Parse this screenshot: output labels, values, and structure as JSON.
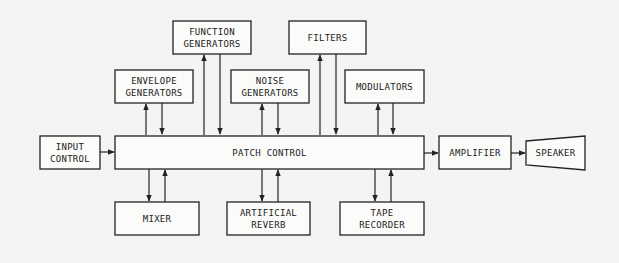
{
  "diagram": {
    "type": "block-diagram",
    "blocks": {
      "function_generators": [
        "FUNCTION",
        "GENERATORS"
      ],
      "filters": [
        "FILTERS"
      ],
      "envelope_generators": [
        "ENVELOPE",
        "GENERATORS"
      ],
      "noise_generators": [
        "NOISE",
        "GENERATORS"
      ],
      "modulators": [
        "MODULATORS"
      ],
      "input_control": [
        "INPUT",
        "CONTROL"
      ],
      "patch_control": [
        "PATCH CONTROL"
      ],
      "amplifier": [
        "AMPLIFIER"
      ],
      "speaker": [
        "SPEAKER"
      ],
      "mixer": [
        "MIXER"
      ],
      "artificial_reverb": [
        "ARTIFICIAL",
        "REVERB"
      ],
      "tape_recorder": [
        "TAPE",
        "RECORDER"
      ]
    },
    "connections": [
      {
        "from": "input_control",
        "to": "patch_control"
      },
      {
        "from": "patch_control",
        "to": "amplifier"
      },
      {
        "from": "amplifier",
        "to": "speaker"
      },
      {
        "from": "patch_control",
        "to": "envelope_generators",
        "bidirectional": true
      },
      {
        "from": "patch_control",
        "to": "function_generators",
        "bidirectional": true
      },
      {
        "from": "patch_control",
        "to": "noise_generators",
        "bidirectional": true
      },
      {
        "from": "patch_control",
        "to": "filters",
        "bidirectional": true
      },
      {
        "from": "patch_control",
        "to": "modulators",
        "bidirectional": true
      },
      {
        "from": "patch_control",
        "to": "mixer",
        "bidirectional": true
      },
      {
        "from": "patch_control",
        "to": "artificial_reverb",
        "bidirectional": true
      },
      {
        "from": "patch_control",
        "to": "tape_recorder",
        "bidirectional": true
      }
    ]
  }
}
